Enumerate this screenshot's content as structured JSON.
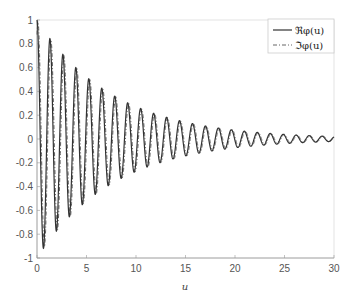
{
  "chart_data": {
    "type": "line",
    "title": "",
    "xlabel": "u",
    "ylabel": "",
    "xlim": [
      0,
      30
    ],
    "ylim": [
      -1,
      1
    ],
    "xticks": [
      0,
      5,
      10,
      15,
      20,
      25,
      30
    ],
    "yticks": [
      -1,
      -0.8,
      -0.6,
      -0.4,
      -0.2,
      0,
      0.2,
      0.4,
      0.6,
      0.8,
      1
    ],
    "grid": false,
    "legend_position": "upper right",
    "series": [
      {
        "name": "ℜφ(u)",
        "style": "solid",
        "color": "#333333",
        "model": "exp(-0.13u)·cos(4.8u)"
      },
      {
        "name": "ℑφ(u)",
        "style": "dash-dot",
        "color": "#666666",
        "model": "exp(-0.13u)·cos(4.8u-0.5)"
      }
    ],
    "envelope_samples": {
      "x": [
        0,
        5,
        10,
        15,
        20,
        25,
        30
      ],
      "amplitude": [
        1.0,
        0.8,
        0.5,
        0.27,
        0.15,
        0.06,
        0.02
      ]
    }
  },
  "legend": {
    "real_label": "ℜφ(u)",
    "imag_label": "ℑφ(u)"
  },
  "axis": {
    "xlabel": "u"
  }
}
